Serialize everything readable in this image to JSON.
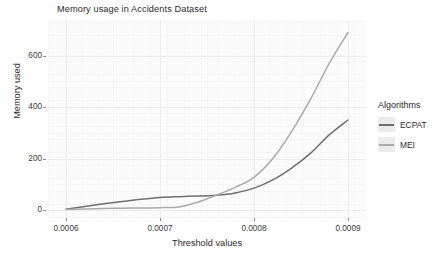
{
  "chart_data": {
    "type": "line",
    "title": "Memory usage in Accidents Dataset",
    "xlabel": "Threshold values",
    "ylabel": "Memory used",
    "xlim": [
      0.0006,
      0.0009
    ],
    "ylim": [
      0,
      700
    ],
    "xticks": [
      "0.0006",
      "0.0007",
      "0.0008",
      "0.0009"
    ],
    "xtick_values": [
      0.0006,
      0.0007,
      0.0008,
      0.0009
    ],
    "yticks": [
      "0",
      "200",
      "400",
      "600"
    ],
    "ytick_values": [
      0,
      200,
      400,
      600
    ],
    "grid": true,
    "legend_position": "right",
    "legend_title": "Algorithms",
    "x": [
      0.0006,
      0.00062,
      0.00064,
      0.00066,
      0.00068,
      0.0007,
      0.00072,
      0.00074,
      0.00076,
      0.00078,
      0.0008,
      0.00082,
      0.00084,
      0.00086,
      0.00088,
      0.0009
    ],
    "series": [
      {
        "name": "ECPAT",
        "color": "#6e6e6e",
        "values": [
          3,
          14,
          24,
          33,
          42,
          49,
          52,
          54,
          57,
          66,
          85,
          117,
          163,
          220,
          292,
          350
        ]
      },
      {
        "name": "MEI",
        "color": "#aaaaaa",
        "values": [
          2,
          4,
          6,
          7,
          8,
          9,
          12,
          30,
          58,
          88,
          127,
          200,
          305,
          430,
          570,
          690
        ]
      }
    ]
  },
  "legend": {
    "title": "Algorithms",
    "entries": [
      {
        "label": "ECPAT",
        "color": "#6e6e6e"
      },
      {
        "label": "MEI",
        "color": "#aaaaaa"
      }
    ]
  }
}
